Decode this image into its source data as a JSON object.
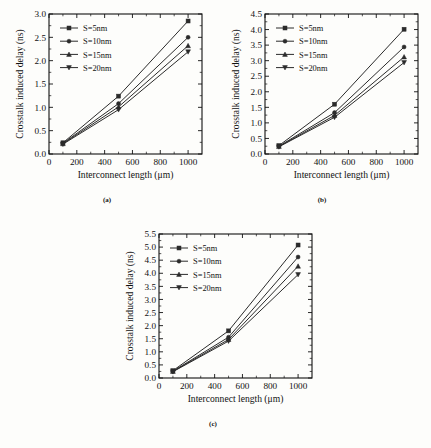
{
  "figure": {
    "axis_x_title": "Interconnect length (μm)",
    "axis_y_title": "Crosstalk induced delay (ns)",
    "captions": {
      "a": "(a)",
      "b": "(b)",
      "c": "(c)"
    },
    "series_names": [
      "S=5nm",
      "S=10nm",
      "S=15nm",
      "S=20nm"
    ],
    "markers": [
      "square",
      "circle",
      "triangle-up",
      "triangle-down"
    ],
    "line_color": "#2b2b2b",
    "background": "#fdfdfb"
  },
  "chart_data": [
    {
      "type": "line",
      "panel": "(a)",
      "title": "",
      "xlabel": "Interconnect length (μm)",
      "ylabel": "Crosstalk induced delay (ns)",
      "x": [
        100,
        500,
        1000
      ],
      "xlim": [
        0,
        1100
      ],
      "ylim": [
        0.0,
        3.0
      ],
      "xticks": [
        0,
        200,
        400,
        600,
        800,
        1000
      ],
      "yticks": [
        0.0,
        0.5,
        1.0,
        1.5,
        2.0,
        2.5,
        3.0
      ],
      "ytick_labels": [
        "0.0",
        "0.5",
        "1.0",
        "1.5",
        "2.0",
        "2.5",
        "3.0"
      ],
      "xtick_labels": [
        "0",
        "200",
        "400",
        "600",
        "800",
        "1000"
      ],
      "grid": false,
      "legend_position": "upper-left",
      "series": [
        {
          "name": "S=5nm",
          "marker": "square",
          "values": [
            0.24,
            1.24,
            2.85
          ]
        },
        {
          "name": "S=10nm",
          "marker": "circle",
          "values": [
            0.23,
            1.08,
            2.5
          ]
        },
        {
          "name": "S=15nm",
          "marker": "triangle-up",
          "values": [
            0.22,
            1.01,
            2.32
          ]
        },
        {
          "name": "S=20nm",
          "marker": "triangle-down",
          "values": [
            0.21,
            0.95,
            2.19
          ]
        }
      ]
    },
    {
      "type": "line",
      "panel": "(b)",
      "title": "",
      "xlabel": "Interconnect length (μm)",
      "ylabel": "Crosstalk induced delay (ns)",
      "x": [
        100,
        500,
        1000
      ],
      "xlim": [
        0,
        1100
      ],
      "ylim": [
        0.0,
        4.5
      ],
      "xticks": [
        0,
        200,
        400,
        600,
        800,
        1000
      ],
      "yticks": [
        0.0,
        0.5,
        1.0,
        1.5,
        2.0,
        2.5,
        3.0,
        3.5,
        4.0,
        4.5
      ],
      "ytick_labels": [
        "0.0",
        "0.5",
        "1.0",
        "1.5",
        "2.0",
        "2.5",
        "3.0",
        "3.5",
        "4.0",
        "4.5"
      ],
      "xtick_labels": [
        "0",
        "200",
        "400",
        "600",
        "800",
        "1000"
      ],
      "grid": false,
      "legend_position": "upper-left",
      "series": [
        {
          "name": "S=5nm",
          "marker": "square",
          "values": [
            0.27,
            1.6,
            4.01
          ]
        },
        {
          "name": "S=10nm",
          "marker": "circle",
          "values": [
            0.25,
            1.33,
            3.44
          ]
        },
        {
          "name": "S=15nm",
          "marker": "triangle-up",
          "values": [
            0.24,
            1.24,
            3.12
          ]
        },
        {
          "name": "S=20nm",
          "marker": "triangle-down",
          "values": [
            0.23,
            1.18,
            2.94
          ]
        }
      ]
    },
    {
      "type": "line",
      "panel": "(c)",
      "title": "",
      "xlabel": "Interconnect length (μm)",
      "ylabel": "Crosstalk induced delay (ns)",
      "x": [
        100,
        500,
        1000
      ],
      "xlim": [
        0,
        1100
      ],
      "ylim": [
        0.0,
        5.5
      ],
      "xticks": [
        0,
        200,
        400,
        600,
        800,
        1000
      ],
      "yticks": [
        0.0,
        0.5,
        1.0,
        1.5,
        2.0,
        2.5,
        3.0,
        3.5,
        4.0,
        4.5,
        5.0,
        5.5
      ],
      "ytick_labels": [
        "0.0",
        "0.5",
        "1.0",
        "1.5",
        "2.0",
        "2.5",
        "3.0",
        "3.5",
        "4.0",
        "4.5",
        "5.0",
        "5.5"
      ],
      "xtick_labels": [
        "0",
        "200",
        "400",
        "600",
        "800",
        "1000"
      ],
      "grid": false,
      "legend_position": "upper-left",
      "series": [
        {
          "name": "S=5nm",
          "marker": "square",
          "values": [
            0.28,
            1.8,
            5.08
          ]
        },
        {
          "name": "S=10nm",
          "marker": "circle",
          "values": [
            0.26,
            1.56,
            4.62
          ]
        },
        {
          "name": "S=15nm",
          "marker": "triangle-up",
          "values": [
            0.25,
            1.47,
            4.27
          ]
        },
        {
          "name": "S=20nm",
          "marker": "triangle-down",
          "values": [
            0.24,
            1.41,
            3.95
          ]
        }
      ]
    }
  ]
}
